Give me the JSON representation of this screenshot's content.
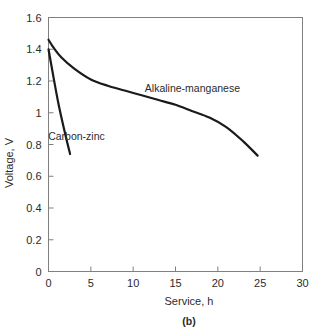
{
  "figure": {
    "panel_label": "(b)",
    "background_color": "#ffffff",
    "axis_color": "#808080",
    "curve_color": "#1a1a1a"
  },
  "chart_data": {
    "type": "line",
    "title": "",
    "subtitle": "",
    "xlabel": "Service, h",
    "ylabel": "Voltage, V",
    "xlim": [
      0,
      30
    ],
    "ylim": [
      0,
      1.6
    ],
    "grid": false,
    "legend_position": "inline-annotation",
    "xticks": [
      0,
      5,
      10,
      15,
      20,
      25,
      30
    ],
    "xtick_labels": [
      "0",
      "5",
      "10",
      "15",
      "20",
      "25",
      "30"
    ],
    "yticks": [
      0,
      0.2,
      0.4,
      0.6,
      0.8,
      1,
      1.2,
      1.4,
      1.6
    ],
    "ytick_labels": [
      "0",
      "0.2",
      "0.4",
      "0.6",
      "0.8",
      "1",
      "1.2",
      "1.4",
      "1.6"
    ],
    "series": [
      {
        "name": "Alkaline-manganese",
        "label_x": 17.0,
        "label_y": 1.13,
        "x": [
          0,
          0.6,
          1.5,
          3,
          5,
          7,
          9,
          11,
          13,
          15,
          17,
          19,
          21,
          23,
          24.7
        ],
        "values": [
          1.46,
          1.41,
          1.35,
          1.28,
          1.21,
          1.17,
          1.14,
          1.11,
          1.08,
          1.05,
          1.01,
          0.97,
          0.91,
          0.82,
          0.73
        ]
      },
      {
        "name": "Carbon-zinc",
        "label_x": 3.3,
        "label_y": 0.83,
        "x": [
          0,
          0.4,
          1.2,
          2.0,
          2.55
        ],
        "values": [
          1.4,
          1.28,
          1.05,
          0.86,
          0.74
        ]
      }
    ]
  }
}
